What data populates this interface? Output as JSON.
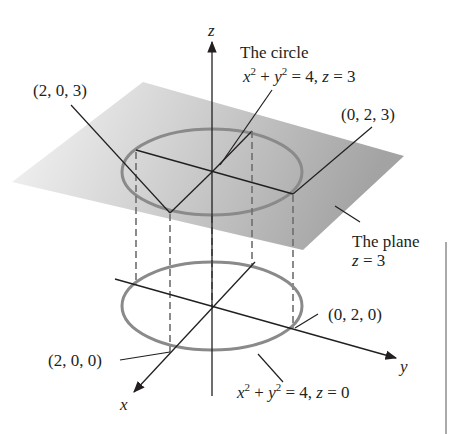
{
  "figure": {
    "axes": {
      "x_label": "x",
      "y_label": "y",
      "z_label": "z"
    },
    "labels": {
      "circle_title": "The circle",
      "circle_eq_upper_x": "x",
      "circle_eq_upper_sup1": "2",
      "circle_eq_upper_plus": " + ",
      "circle_eq_upper_y": "y",
      "circle_eq_upper_sup2": "2",
      "circle_eq_upper_rest": " = 4,  ",
      "circle_eq_upper_z": "z",
      "circle_eq_upper_end": " = 3",
      "point_2_0_3": "(2, 0, 3)",
      "point_0_2_3": "(0, 2, 3)",
      "plane_title": "The plane",
      "plane_eq_z": "z",
      "plane_eq_rest": " = 3",
      "point_0_2_0": "(0, 2, 0)",
      "point_2_0_0": "(2, 0, 0)",
      "circle_eq_lower_x": "x",
      "circle_eq_lower_sup1": "2",
      "circle_eq_lower_plus": " + ",
      "circle_eq_lower_y": "y",
      "circle_eq_lower_sup2": "2",
      "circle_eq_lower_rest": " = 4, ",
      "circle_eq_lower_z": "z",
      "circle_eq_lower_end": " = 0"
    },
    "colors": {
      "plane_light": "#f4f4f4",
      "plane_dark": "#a9a9a9",
      "circle": "#8a8a8a",
      "ink": "#231f20"
    }
  }
}
